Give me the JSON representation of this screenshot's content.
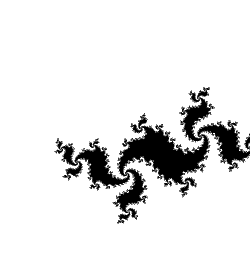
{
  "figure": {
    "title": "Julia set dendrite",
    "width": 250,
    "height": 280,
    "background_color": "#ffffff",
    "ink_color": "#000000"
  },
  "chart_data": {
    "type": "scatter",
    "title": "Julia set dendrite",
    "subtitle": "",
    "xlabel": "",
    "ylabel": "",
    "grid": false,
    "legend": null,
    "render": {
      "algorithm": "julia-escape-time",
      "formula": "z -> z^2 + c",
      "c_real": -0.21,
      "c_imag": 0.715,
      "max_iterations": 220,
      "escape_radius": 2.0,
      "interior_color": "#000000",
      "exterior_color": "#ffffff",
      "supersample": 3,
      "edge_softness": 0.55
    },
    "view": {
      "center_x": 0.02,
      "center_y": 0.0,
      "scale_x": 1.62,
      "scale_y": 1.62,
      "rotation_degrees": -28,
      "aspect_correction": 1.12
    },
    "xlim": [
      -1.6,
      1.64
    ],
    "ylim": [
      -1.81,
      1.81
    ],
    "bounding_box_pixels": {
      "left": 22,
      "top": 12,
      "right": 241,
      "bottom": 266
    },
    "annotations": []
  }
}
